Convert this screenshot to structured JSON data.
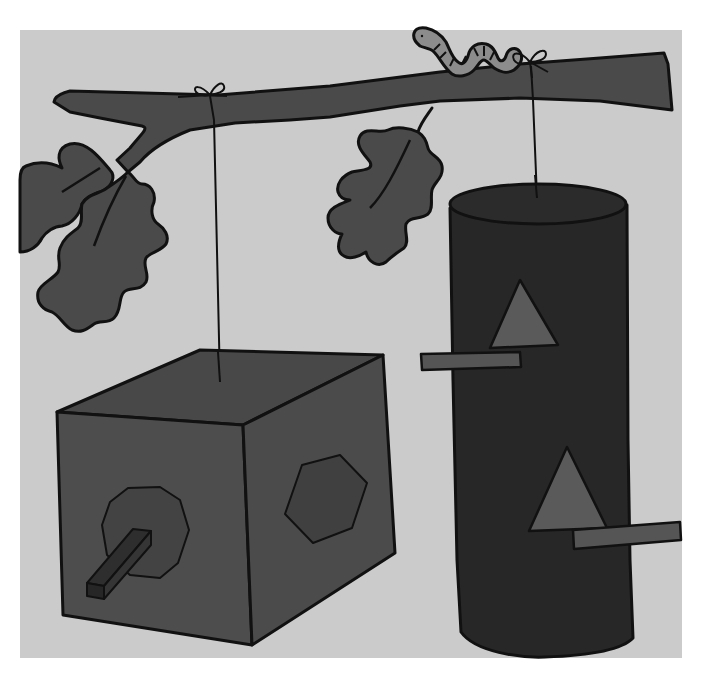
{
  "scene": {
    "caption": "Illustration: a box birdhouse and a cylinder birdhouse hanging by strings from an oak branch, with a worm on the branch",
    "colors": {
      "page_background": "#ffffff",
      "panel_background": "#cbcbcb",
      "outline": "#111111",
      "branch": "#4a4a4a",
      "leaf": "#4a4a4a",
      "worm": "#8c8c8c",
      "box_face": "#4d4d4d",
      "box_side": "#4b4b4b",
      "box_top": "#484848",
      "octagon_opening": "#434343",
      "hexagon_opening": "#404040",
      "box_perch": "#2e2e2e",
      "cylinder_body": "#272727",
      "cylinder_top": "#2b2b2b",
      "triangle_opening": "#5a5a5a",
      "cylinder_perch": "#555555",
      "string": "#111111"
    },
    "objects": [
      {
        "name": "oak-branch",
        "kind": "branch"
      },
      {
        "name": "worm",
        "kind": "worm",
        "position": "on top of branch"
      },
      {
        "name": "oak-leaf-left-pair",
        "kind": "leaves",
        "count": 2
      },
      {
        "name": "oak-leaf-center",
        "kind": "leaf",
        "count": 1
      },
      {
        "name": "box-birdhouse",
        "kind": "cube",
        "openings": [
          "octagon",
          "hexagon"
        ],
        "perch": "square stick"
      },
      {
        "name": "cylinder-birdhouse",
        "kind": "cylinder",
        "openings": [
          "triangle",
          "triangle"
        ],
        "perches": 2
      },
      {
        "name": "string-left",
        "kind": "string",
        "tied_with": "bow"
      },
      {
        "name": "string-right",
        "kind": "string",
        "tied_with": "bow"
      }
    ]
  }
}
